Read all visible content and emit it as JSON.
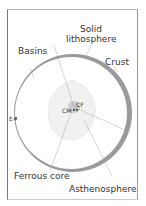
{
  "diagram": {
    "labels": {
      "solid": "Solid",
      "lithosphere": "lithosphere",
      "basins": "Basins",
      "crust": "Crust",
      "e_plus": "E+",
      "cm": "CM",
      "cf": "CF",
      "ferrous_core": "Ferrous core",
      "asthenosphere": "Asthenosphere"
    },
    "colors": {
      "frame": "#777777",
      "crust": "#9a9a9a",
      "core": "#cccccc",
      "text": "#333333"
    }
  }
}
